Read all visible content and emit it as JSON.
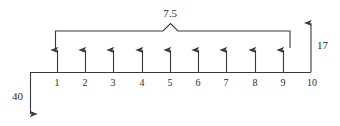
{
  "diagram": {
    "type": "beam-load-diagram",
    "colors": {
      "line": "#3a3a3a",
      "text": "#2b2b2b",
      "background": "#ffffff"
    },
    "span_bracket": {
      "label": "7.5",
      "from_station": "1",
      "to_station": "9"
    },
    "right_reaction": {
      "label": "17",
      "at_station": "10",
      "direction": "up"
    },
    "left_reaction": {
      "label": "40",
      "at_station": "0",
      "direction": "down"
    },
    "stations": [
      {
        "label": "1",
        "x": 57
      },
      {
        "label": "2",
        "x": 85
      },
      {
        "label": "3",
        "x": 113
      },
      {
        "label": "4",
        "x": 142
      },
      {
        "label": "5",
        "x": 170
      },
      {
        "label": "6",
        "x": 198
      },
      {
        "label": "7",
        "x": 226
      },
      {
        "label": "8",
        "x": 255
      },
      {
        "label": "9",
        "x": 283
      },
      {
        "label": "10",
        "x": 311
      }
    ]
  }
}
